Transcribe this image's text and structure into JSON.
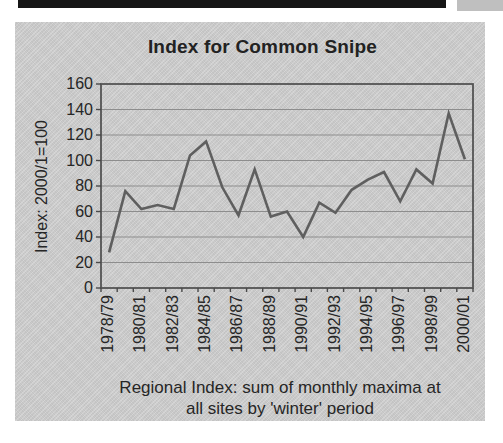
{
  "chart": {
    "title": "Index for Common Snipe",
    "y_axis_title": "Index: 2000/1=100",
    "caption_line1": "Regional Index: sum of monthly maxima at",
    "caption_line2": "all sites by 'winter' period"
  },
  "chart_data": {
    "type": "line",
    "title": "Index for Common Snipe",
    "ylabel": "Index: 2000/1=100",
    "xlabel": "Regional Index: sum of monthly maxima at all sites by 'winter' period",
    "categories": [
      "1978/79",
      "1979/80",
      "1980/81",
      "1981/82",
      "1982/83",
      "1983/84",
      "1984/85",
      "1985/86",
      "1986/87",
      "1987/88",
      "1988/89",
      "1989/90",
      "1990/91",
      "1991/92",
      "1992/93",
      "1993/94",
      "1994/95",
      "1995/96",
      "1996/97",
      "1997/98",
      "1998/99",
      "1999/00",
      "2000/01"
    ],
    "values": [
      28,
      76,
      62,
      65,
      62,
      104,
      115,
      79,
      57,
      93,
      56,
      60,
      40,
      67,
      59,
      77,
      85,
      91,
      68,
      93,
      82,
      137,
      101
    ],
    "x_tick_labels_shown": [
      "1978/79",
      "1980/81",
      "1982/83",
      "1984/85",
      "1986/87",
      "1988/89",
      "1990/91",
      "1992/93",
      "1994/95",
      "1996/97",
      "1998/99",
      "2000/01"
    ],
    "ylim": [
      0,
      160
    ],
    "y_tick_step": 20,
    "y_ticks": [
      0,
      20,
      40,
      60,
      80,
      100,
      120,
      140,
      160
    ],
    "grid": "horizontal-only",
    "legend": "none",
    "series_color": "#5f5f5f",
    "plot_bg": "#cbcbcb",
    "text_color": "#262626",
    "grid_color": "#8d8d8d",
    "frame_color": "#545454"
  }
}
